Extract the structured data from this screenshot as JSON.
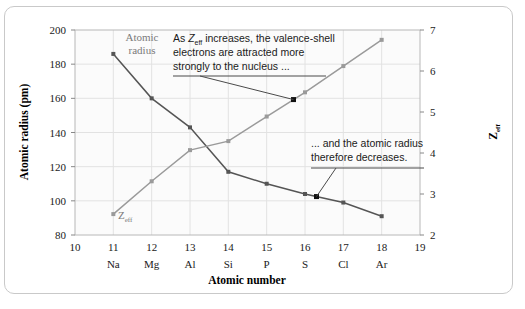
{
  "chart_data": {
    "type": "line",
    "title": "",
    "xlabel": "Atomic number",
    "ylabel": "Atomic radius (pm)",
    "y2label": "Zeff",
    "grid": true,
    "legend_position": "inline-labels",
    "xlim": [
      10,
      19
    ],
    "ylim": [
      80,
      200
    ],
    "y2lim": [
      2,
      7
    ],
    "x": [
      11,
      12,
      13,
      14,
      15,
      16,
      17,
      18
    ],
    "xtick_values": [
      10,
      11,
      12,
      13,
      14,
      15,
      16,
      17,
      18,
      19
    ],
    "xtick_labels": [
      "10",
      "11",
      "12",
      "13",
      "14",
      "15",
      "16",
      "17",
      "18",
      "19"
    ],
    "element_labels": [
      "Na",
      "Mg",
      "Al",
      "Si",
      "P",
      "S",
      "Cl",
      "Ar"
    ],
    "ytick_values": [
      80,
      100,
      120,
      140,
      160,
      180,
      200
    ],
    "ytick_labels": [
      "80",
      "100",
      "120",
      "140",
      "160",
      "180",
      "200"
    ],
    "y2tick_values": [
      2,
      3,
      4,
      5,
      6,
      7
    ],
    "y2tick_labels": [
      "2",
      "3",
      "4",
      "5",
      "6",
      "7"
    ],
    "series": [
      {
        "name": "Atomic radius",
        "axis": "left",
        "color": "#555555",
        "values": [
          186,
          160,
          143,
          117,
          110,
          104,
          99,
          91
        ]
      },
      {
        "name": "Zeff",
        "axis": "right",
        "color": "#9a9a9a",
        "values": [
          2.51,
          3.31,
          4.07,
          4.29,
          4.89,
          5.48,
          6.12,
          6.76
        ]
      }
    ],
    "annotations": [
      {
        "id": "zeff-annotation",
        "lines": [
          "As Zeff increases, the valence-shell",
          "electrons are attracted more",
          "strongly to the nucleus ..."
        ],
        "line1_prefix": "As ",
        "line1_symbol": "Z",
        "line1_subscript": "eff",
        "line1_suffix": " increases, the valence-shell",
        "points_to_x": 15.7,
        "points_to_series": "Zeff"
      },
      {
        "id": "radius-annotation",
        "lines": [
          "... and the atomic radius",
          "therefore decreases."
        ],
        "points_to_x": 16.3,
        "points_to_series": "Atomic radius"
      }
    ],
    "series_label_atomic_radius": "Atomic",
    "series_label_atomic_radius_line2": "radius",
    "series_label_zeff": "Z",
    "series_label_zeff_sub": "eff"
  }
}
